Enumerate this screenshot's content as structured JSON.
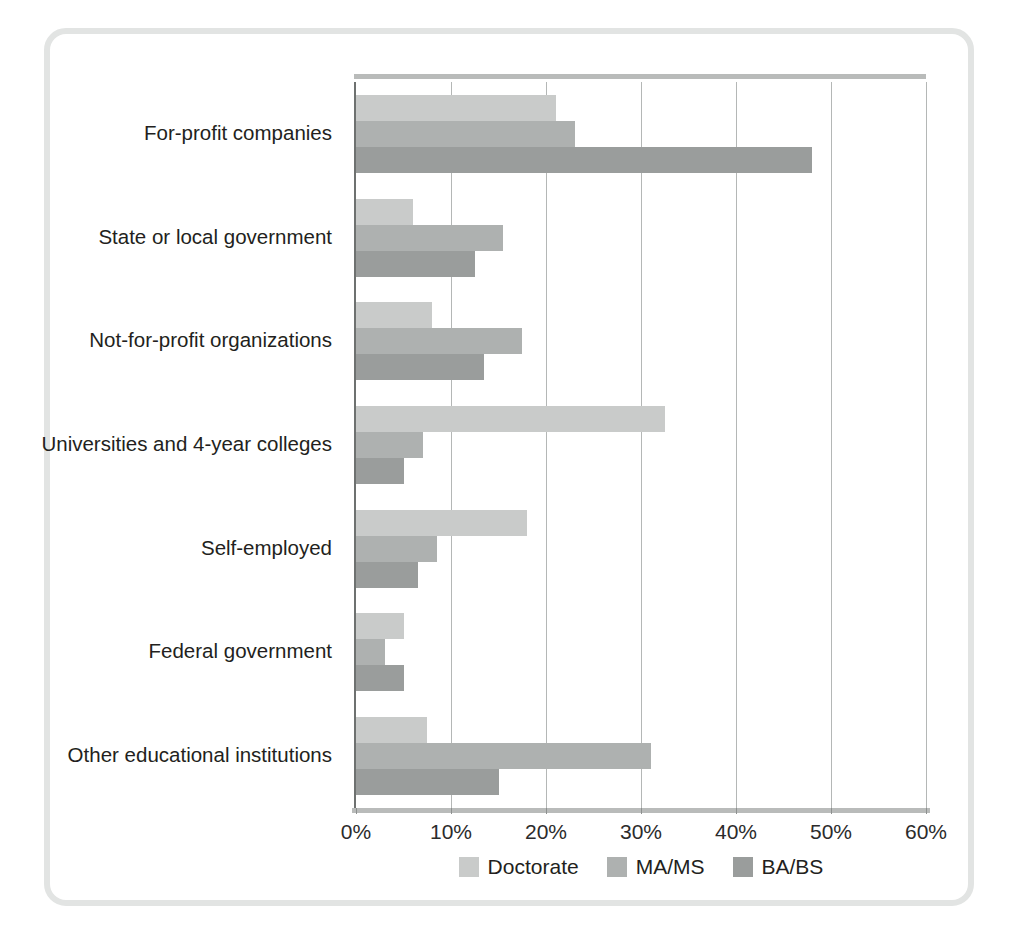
{
  "figure": {
    "frame_color": "#e2e4e3",
    "background": "#ffffff"
  },
  "chart_data": {
    "type": "bar",
    "orientation": "horizontal",
    "title": "",
    "subtitle": "",
    "xlabel": "",
    "ylabel": "",
    "xlim": [
      0,
      60
    ],
    "xticks": [
      0,
      10,
      20,
      30,
      40,
      50,
      60
    ],
    "xtick_labels": [
      "0%",
      "10%",
      "20%",
      "30%",
      "40%",
      "50%",
      "60%"
    ],
    "grid": "vertical",
    "legend_position": "bottom-center",
    "categories": [
      "For-profit companies",
      "State or local government",
      "Not-for-profit organizations",
      "Universities and 4-year colleges",
      "Self-employed",
      "Federal government",
      "Other educational institutions"
    ],
    "series": [
      {
        "name": "Doctorate",
        "color": "#c9cbca",
        "values": [
          21,
          6,
          8,
          32.5,
          18,
          5,
          7.5
        ]
      },
      {
        "name": "MA/MS",
        "color": "#aeb1b0",
        "values": [
          23,
          15.5,
          17.5,
          7,
          8.5,
          3,
          31
        ]
      },
      {
        "name": "BA/BS",
        "color": "#9a9d9c",
        "values": [
          48,
          12.5,
          13.5,
          5,
          6.5,
          5,
          15
        ]
      }
    ]
  }
}
